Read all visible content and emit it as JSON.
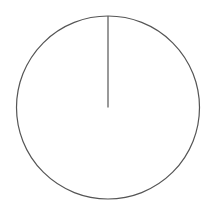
{
  "chart_data": {
    "type": "pie",
    "title": "",
    "categories": [
      ""
    ],
    "values": [
      100
    ],
    "legend": [],
    "center": [
      108,
      107.5
    ],
    "radius": 91.5,
    "start_angle_deg": 90,
    "colors": {
      "fill": "#ffffff",
      "stroke": "#555555",
      "background": "#ffffff"
    }
  }
}
